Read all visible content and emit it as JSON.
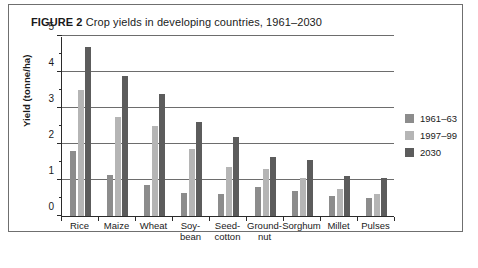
{
  "figure": {
    "number_label": "FIGURE 2",
    "title_text": "Crop yields in developing countries, 1961–2030"
  },
  "axes": {
    "y_axis_title": "Yield (tonne/ha)",
    "y_tick_labels": [
      "0",
      "1",
      "2",
      "3",
      "4",
      "5"
    ],
    "x_tick_labels": [
      "Rice",
      "Maize",
      "Wheat",
      "Soy-\nbean",
      "Seed-\ncotton",
      "Ground-\nnut",
      "Sorghum",
      "Millet",
      "Pulses"
    ]
  },
  "legend": {
    "entries": [
      {
        "label": "1961–63",
        "color": "#8c8c8c"
      },
      {
        "label": "1997–99",
        "color": "#b5b5b5"
      },
      {
        "label": "2030",
        "color": "#5c5c5c"
      }
    ]
  },
  "chart_data": {
    "type": "bar",
    "title": "FIGURE 2 Crop yields in developing countries, 1961–2030",
    "xlabel": "",
    "ylabel": "Yield (tonne/ha)",
    "ylim": [
      0,
      5
    ],
    "ytick_step": 1,
    "yminor_step": 0.5,
    "grid": true,
    "legend_position": "right",
    "categories": [
      "Rice",
      "Maize",
      "Wheat",
      "Soy-bean",
      "Seed-cotton",
      "Ground-nut",
      "Sorghum",
      "Millet",
      "Pulses"
    ],
    "series": [
      {
        "name": "1961–63",
        "color": "#8c8c8c",
        "values": [
          1.8,
          1.15,
          0.85,
          0.65,
          0.6,
          0.8,
          0.7,
          0.55,
          0.5
        ]
      },
      {
        "name": "1997–99",
        "color": "#b5b5b5",
        "values": [
          3.5,
          2.75,
          2.5,
          1.85,
          1.35,
          1.3,
          1.05,
          0.75,
          0.6
        ]
      },
      {
        "name": "2030",
        "color": "#5c5c5c",
        "values": [
          4.7,
          3.9,
          3.4,
          2.6,
          2.2,
          1.65,
          1.55,
          1.1,
          1.05
        ]
      }
    ]
  }
}
